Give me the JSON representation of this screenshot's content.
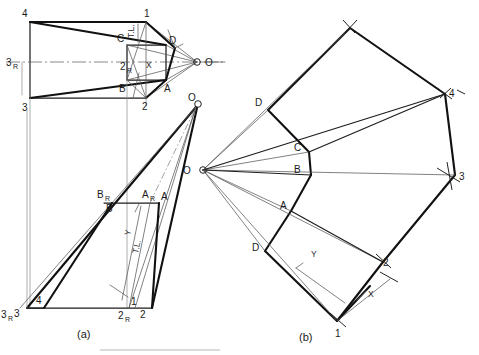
{
  "page": {
    "background_color": "#ffffff",
    "ink_color": "#111111"
  },
  "captions": {
    "left": "(a)",
    "right": "(b)"
  },
  "figure_a": {
    "name": "orthographic-views",
    "top_view": {
      "name": "top-view",
      "labels": [
        {
          "id": "v4",
          "text": "4",
          "x": 22,
          "y": 17
        },
        {
          "id": "v3",
          "text": "3",
          "x": 22,
          "y": 108
        },
        {
          "id": "v3r",
          "text": "3",
          "sub": "R",
          "x": 8,
          "y": 66
        },
        {
          "id": "v1",
          "text": "1",
          "x": 148,
          "y": 17
        },
        {
          "id": "v2",
          "text": "2",
          "x": 142,
          "y": 94
        },
        {
          "id": "v2r",
          "text": "2",
          "sub": "R",
          "x": 123,
          "y": 70
        },
        {
          "id": "vC",
          "text": "C",
          "x": 117,
          "y": 42
        },
        {
          "id": "vD",
          "text": "D",
          "x": 170,
          "y": 44
        },
        {
          "id": "vB",
          "text": "B",
          "x": 120,
          "y": 90
        },
        {
          "id": "vA",
          "text": "A",
          "x": 166,
          "y": 90
        },
        {
          "id": "vO",
          "text": "O",
          "x": 207,
          "y": 64
        },
        {
          "id": "vX",
          "text": "X",
          "x": 149,
          "y": 69
        },
        {
          "id": "vTL",
          "text": "T.L.",
          "x": 133,
          "y": 34
        }
      ]
    },
    "front_view": {
      "name": "front-view",
      "labels": [
        {
          "id": "f3r",
          "text": "3",
          "sub": "R",
          "x": 2,
          "y": 315
        },
        {
          "id": "f3",
          "text": "3",
          "x": 18,
          "y": 312
        },
        {
          "id": "f4",
          "text": "4",
          "x": 37,
          "y": 302
        },
        {
          "id": "f1",
          "text": "1",
          "x": 128,
          "y": 303
        },
        {
          "id": "f2r",
          "text": "2",
          "sub": "R",
          "x": 121,
          "y": 315
        },
        {
          "id": "f2",
          "text": "2",
          "x": 143,
          "y": 312
        },
        {
          "id": "fBR",
          "text": "B",
          "sub": "R",
          "x": 102,
          "y": 195
        },
        {
          "id": "fB",
          "text": "B",
          "x": 109,
          "y": 208
        },
        {
          "id": "fAR",
          "text": "A",
          "sub": "R",
          "x": 147,
          "y": 195
        },
        {
          "id": "fA",
          "text": "A",
          "x": 166,
          "y": 196
        },
        {
          "id": "fO",
          "text": "O",
          "x": 190,
          "y": 102
        },
        {
          "id": "fY",
          "text": "Y",
          "x": 131,
          "y": 232
        },
        {
          "id": "fTL",
          "text": "T.L.",
          "x": 137,
          "y": 248
        }
      ]
    }
  },
  "figure_b": {
    "name": "development-pattern",
    "apex_label": "O",
    "labels": [
      {
        "id": "dO",
        "text": "O",
        "x": 186,
        "y": 173
      },
      {
        "id": "dD1",
        "text": "D",
        "x": 258,
        "y": 103
      },
      {
        "id": "dC",
        "text": "C",
        "x": 296,
        "y": 148
      },
      {
        "id": "dB",
        "text": "B",
        "x": 296,
        "y": 170
      },
      {
        "id": "dA",
        "text": "A",
        "x": 283,
        "y": 205
      },
      {
        "id": "dD2",
        "text": "D",
        "x": 255,
        "y": 247
      },
      {
        "id": "d1",
        "text": "1",
        "x": 337,
        "y": 333
      },
      {
        "id": "d2",
        "text": "2",
        "x": 384,
        "y": 265
      },
      {
        "id": "d3",
        "text": "3",
        "x": 459,
        "y": 179
      },
      {
        "id": "d4",
        "text": "4",
        "x": 450,
        "y": 96
      },
      {
        "id": "dX",
        "text": "X",
        "x": 369,
        "y": 294
      },
      {
        "id": "dY",
        "text": "Y",
        "x": 313,
        "y": 254
      }
    ]
  },
  "geometry": {
    "top_view": {
      "pts": {
        "p4": [
          30,
          22
        ],
        "p3": [
          30,
          98
        ],
        "p1": [
          146,
          22
        ],
        "p2": [
          146,
          98
        ],
        "C": [
          127,
          45
        ],
        "D": [
          166,
          45
        ],
        "B": [
          127,
          80
        ],
        "A": [
          166,
          80
        ],
        "O": [
          197,
          62
        ],
        "p3R": [
          22,
          62
        ],
        "p2R": [
          127,
          62
        ],
        "X": [
          157,
          62
        ]
      }
    },
    "front_view": {
      "pts": {
        "f3": [
          27,
          308
        ],
        "f3R": [
          20,
          308
        ],
        "f4": [
          44,
          308
        ],
        "f1": [
          135,
          308
        ],
        "f2R": [
          129,
          308
        ],
        "f2": [
          152,
          308
        ],
        "B": [
          112,
          203
        ],
        "BR": [
          104,
          203
        ],
        "A": [
          159,
          203
        ],
        "AR": [
          150,
          203
        ],
        "O": [
          198,
          104
        ]
      }
    },
    "development": {
      "pts": {
        "O": [
          203,
          170
        ],
        "top": [
          350,
          28
        ],
        "D1": [
          268,
          110
        ],
        "C": [
          309,
          152
        ],
        "B": [
          311,
          175
        ],
        "A": [
          291,
          211
        ],
        "D2": [
          265,
          251
        ],
        "p1": [
          337,
          321
        ],
        "p2": [
          383,
          262
        ],
        "p3": [
          455,
          175
        ],
        "p4": [
          445,
          94
        ]
      }
    }
  }
}
